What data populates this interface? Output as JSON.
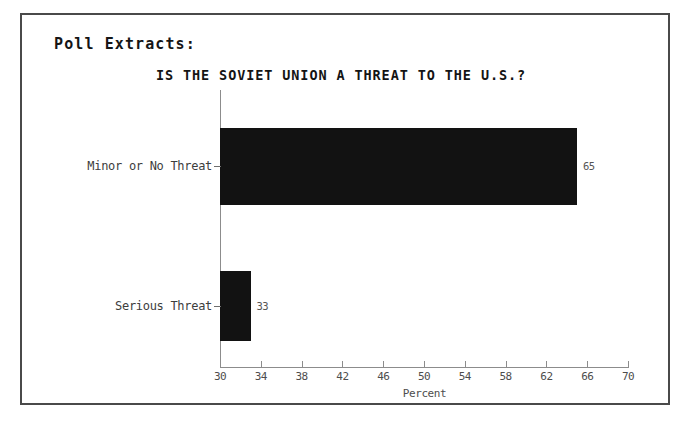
{
  "document": {
    "section_heading": "Poll Extracts:"
  },
  "chart_data": {
    "type": "bar",
    "orientation": "horizontal",
    "title": "IS THE SOVIET UNION A THREAT TO THE U.S.?",
    "xlabel": "Percent",
    "ylabel": "",
    "categories": [
      "Minor or No Threat",
      "Serious Threat"
    ],
    "values": [
      65,
      33
    ],
    "value_labels": [
      "65",
      "33"
    ],
    "xlim": [
      30,
      70
    ],
    "xticks": [
      30,
      34,
      38,
      42,
      46,
      50,
      54,
      58,
      62,
      66,
      70
    ],
    "xtick_labels": [
      "30",
      "34",
      "38",
      "42",
      "46",
      "50",
      "54",
      "58",
      "62",
      "66",
      "70"
    ],
    "grid": false,
    "legend": false,
    "bar_color": "#121212",
    "axis_color": "#8c8c8c"
  }
}
